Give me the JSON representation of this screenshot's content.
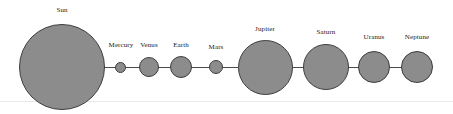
{
  "figure": {
    "name": "solar-system-relative-sizes",
    "background_color": "#ffffff",
    "body_fill_color": "#8c8c8c",
    "body_stroke_color": "#3d3d3d",
    "connector_color": "#4a4a4a",
    "label_color": "#1a1a1a"
  },
  "chart_data": {
    "type": "scatter",
    "title": "",
    "xlabel": "",
    "ylabel": "",
    "grid": false,
    "legend": null,
    "axis_visible": false,
    "categories": [
      "Sun",
      "Mercury",
      "Venus",
      "Earth",
      "Mars",
      "Jupiter",
      "Saturn",
      "Uranus",
      "Neptune"
    ],
    "radii_px": [
      43,
      5.5,
      10,
      11,
      7,
      27.5,
      23,
      16,
      16
    ],
    "center_x_px": [
      62,
      120.5,
      149,
      181,
      216,
      265,
      326,
      374,
      417
    ],
    "center_y_px": [
      67,
      67,
      67,
      67,
      67,
      67,
      67,
      67,
      67
    ]
  },
  "bodies": [
    {
      "id": "sun",
      "label": "Sun",
      "cx": 62,
      "cy": 67,
      "r": 43,
      "label_x": 62,
      "label_y": 6
    },
    {
      "id": "mercury",
      "label": "Mercury",
      "cx": 120.5,
      "cy": 67,
      "r": 5.5,
      "label_x": 121,
      "label_y": 41
    },
    {
      "id": "venus",
      "label": "Venus",
      "cx": 149,
      "cy": 67,
      "r": 10,
      "label_x": 149,
      "label_y": 41
    },
    {
      "id": "earth",
      "label": "Earth",
      "cx": 181,
      "cy": 67,
      "r": 11,
      "label_x": 181,
      "label_y": 41
    },
    {
      "id": "mars",
      "label": "Mars",
      "cx": 216,
      "cy": 67,
      "r": 7,
      "label_x": 216,
      "label_y": 43
    },
    {
      "id": "jupiter",
      "label": "Jupiter",
      "cx": 265,
      "cy": 67,
      "r": 27.5,
      "label_x": 265,
      "label_y": 25
    },
    {
      "id": "saturn",
      "label": "Saturn",
      "cx": 326,
      "cy": 67,
      "r": 23,
      "label_x": 326,
      "label_y": 28
    },
    {
      "id": "uranus",
      "label": "Uranus",
      "cx": 374,
      "cy": 67,
      "r": 16,
      "label_x": 374,
      "label_y": 33
    },
    {
      "id": "neptune",
      "label": "Neptune",
      "cx": 417,
      "cy": 67,
      "r": 16,
      "label_x": 417,
      "label_y": 33
    }
  ],
  "connectors": [
    {
      "id": "sun-mercury",
      "left": 104,
      "width": 12
    },
    {
      "id": "mercury-venus",
      "left": 125,
      "width": 15
    },
    {
      "id": "venus-earth",
      "left": 158,
      "width": 13
    },
    {
      "id": "earth-mars",
      "left": 191,
      "width": 19
    },
    {
      "id": "mars-jupiter",
      "left": 222,
      "width": 16
    },
    {
      "id": "jupiter-saturn",
      "left": 292,
      "width": 12
    },
    {
      "id": "saturn-uranus",
      "left": 348,
      "width": 11
    },
    {
      "id": "uranus-neptune",
      "left": 389,
      "width": 13
    }
  ]
}
